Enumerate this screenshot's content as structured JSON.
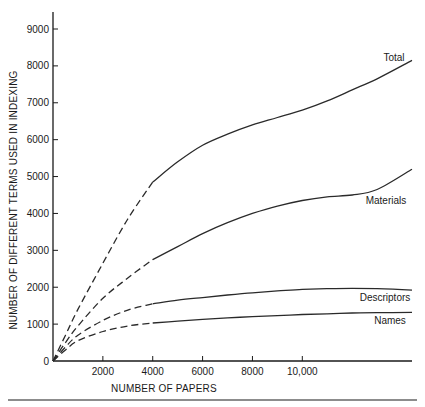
{
  "chart_data": {
    "type": "line",
    "title": "",
    "xlabel": "NUMBER OF PAPERS",
    "ylabel": "NUMBER OF DIFFERENT TERMS USED IN INDEXING",
    "xlim": [
      0,
      14400
    ],
    "ylim": [
      0,
      9000
    ],
    "x_ticks": [
      2000,
      4000,
      6000,
      8000,
      10000
    ],
    "x_tick_labels": [
      "2000",
      "4000",
      "6000",
      "8000",
      "10,000"
    ],
    "y_ticks": [
      0,
      1000,
      2000,
      3000,
      4000,
      5000,
      6000,
      7000,
      8000,
      9000
    ],
    "y_tick_labels": [
      "0",
      "1000",
      "2000",
      "3000",
      "4000",
      "5000",
      "6000",
      "7000",
      "8000",
      "9000"
    ],
    "grid": false,
    "legend": "inline labels at right end of each curve",
    "dashed_until_x": 4000,
    "x": [
      0,
      500,
      1000,
      2000,
      3000,
      4000,
      5000,
      6000,
      7000,
      8000,
      9000,
      10000,
      11000,
      12000,
      13000,
      14400
    ],
    "series": [
      {
        "name": "Total",
        "label": "Total",
        "values": [
          0,
          700,
          1400,
          2650,
          3850,
          4850,
          5400,
          5850,
          6150,
          6400,
          6600,
          6800,
          7050,
          7350,
          7650,
          8150
        ]
      },
      {
        "name": "Materials",
        "label": "Materials",
        "values": [
          0,
          500,
          950,
          1700,
          2250,
          2750,
          3100,
          3450,
          3750,
          4000,
          4200,
          4350,
          4450,
          4500,
          4650,
          5200
        ]
      },
      {
        "name": "Descriptors",
        "label": "Descriptors",
        "values": [
          0,
          380,
          700,
          1100,
          1380,
          1550,
          1650,
          1720,
          1790,
          1850,
          1900,
          1940,
          1960,
          1970,
          1960,
          1920
        ]
      },
      {
        "name": "Names",
        "label": "Names",
        "values": [
          0,
          300,
          550,
          800,
          950,
          1030,
          1080,
          1130,
          1170,
          1200,
          1230,
          1260,
          1280,
          1300,
          1310,
          1320
        ]
      }
    ]
  },
  "axes": {
    "x_title": "NUMBER OF PAPERS",
    "y_title": "NUMBER OF DIFFERENT TERMS USED IN INDEXING",
    "x_tick_labels": [
      "2000",
      "4000",
      "6000",
      "8000",
      "10,000"
    ],
    "y_tick_labels": [
      "0",
      "1000",
      "2000",
      "3000",
      "4000",
      "5000",
      "6000",
      "7000",
      "8000",
      "9000"
    ]
  },
  "series_labels": {
    "total": "Total",
    "materials": "Materials",
    "descriptors": "Descriptors",
    "names": "Names"
  }
}
